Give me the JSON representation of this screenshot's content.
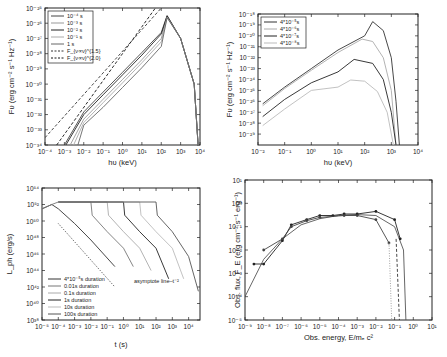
{
  "chart_data": [
    {
      "id": "panel_a",
      "type": "line",
      "title": "",
      "xlabel": "hν (keV)",
      "ylabel": "Fν (erg cm⁻² s⁻¹ Hz⁻¹)",
      "xscale": "log",
      "yscale": "log",
      "xlim": [
        0.0001,
        10000.0
      ],
      "ylim": [
        1e-34,
        1e-25
      ],
      "xticks": [
        "10⁻⁴",
        "10⁻³",
        "10⁻²",
        "10⁻¹",
        "10⁰",
        "10¹",
        "10²",
        "10³",
        "10⁴"
      ],
      "yticks": [
        "10⁻³⁴",
        "10⁻³³",
        "10⁻³²",
        "10⁻³¹",
        "10⁻³⁰",
        "10⁻²⁹",
        "10⁻²⁸",
        "10⁻²⁷",
        "10⁻²⁶",
        "10⁻²⁵"
      ],
      "legend_position": "upper left",
      "series": [
        {
          "name": "10⁻⁴ s",
          "style": "solid",
          "color": "#444444",
          "x": [
            0.001,
            0.01,
            0.1,
            1,
            10,
            100,
            200,
            1000,
            5000,
            8000
          ],
          "y": [
            1e-34,
            1.5e-32,
            3e-31,
            6e-30,
            1.2e-28,
            2.5e-27,
            3.2e-26,
            1e-27,
            1e-30,
            1e-34
          ]
        },
        {
          "name": "10⁻³ s",
          "style": "solid",
          "color": "#999999",
          "x": [
            0.002,
            0.01,
            0.1,
            1,
            10,
            100,
            200,
            1000,
            5000,
            8000
          ],
          "y": [
            1e-34,
            5e-33,
            1e-31,
            2e-30,
            4e-29,
            1e-27,
            2.7e-26,
            1e-27,
            1e-30,
            1e-34
          ]
        },
        {
          "name": "10⁻² s",
          "style": "solid",
          "color": "#222222",
          "x": [
            0.0012,
            0.01,
            0.1,
            1,
            10,
            100,
            200,
            1000,
            5000,
            8000
          ],
          "y": [
            1e-34,
            1e-32,
            2e-31,
            4e-30,
            8e-29,
            2e-27,
            3e-26,
            1e-27,
            1e-30,
            1e-34
          ]
        },
        {
          "name": "10⁻¹ s",
          "style": "solid",
          "color": "#aaaaaa",
          "x": [
            0.003,
            0.01,
            0.1,
            1,
            10,
            100,
            200,
            1000,
            5000,
            8000
          ],
          "y": [
            1e-34,
            3e-33,
            6e-32,
            1.2e-30,
            2.5e-29,
            6e-28,
            2.5e-26,
            1e-27,
            1e-30,
            1e-34
          ]
        },
        {
          "name": "1   s",
          "style": "solid",
          "color": "#666666",
          "x": [
            0.005,
            0.01,
            0.1,
            1,
            10,
            100,
            200,
            1000,
            5000,
            8000
          ],
          "y": [
            1e-34,
            2e-33,
            3e-32,
            6e-31,
            1.2e-29,
            3e-28,
            2.3e-26,
            1e-27,
            1e-30,
            1e-34
          ]
        },
        {
          "name": "F_{ν∝ν}^{1.5}",
          "style": "dashed",
          "color": "#333333",
          "x": [
            0.0001,
            100
          ],
          "y": [
            3e-34,
            1e-25
          ]
        },
        {
          "name": "F_{ν∝ν}^{2.0}",
          "style": "dashed",
          "color": "#111111",
          "x": [
            0.0004,
            50
          ],
          "y": [
            1e-34,
            1e-25
          ]
        }
      ]
    },
    {
      "id": "panel_b",
      "type": "line",
      "title": "",
      "xlabel": "hν (keV)",
      "ylabel": "Fν (erg cm⁻² s⁻¹ Hz⁻¹)",
      "xscale": "log",
      "yscale": "log",
      "xlim": [
        0.01,
        10000.0
      ],
      "ylim": [
        1e-30,
        1e-18
      ],
      "xticks": [
        "10⁻²",
        "10⁻¹",
        "10⁰",
        "10¹",
        "10²",
        "10³",
        "10⁴"
      ],
      "yticks": [
        "10⁻²⁹",
        "10⁻²⁸",
        "10⁻²⁷",
        "10⁻²⁶",
        "10⁻²⁵",
        "10⁻²⁴",
        "10⁻²³",
        "10⁻²²",
        "10⁻²¹",
        "10⁻²⁰",
        "10⁻¹⁹",
        "10⁻¹⁸"
      ],
      "legend_position": "upper left",
      "series": [
        {
          "name": "4*10⁻⁵s",
          "color": "#333333",
          "x": [
            0.015,
            0.1,
            1,
            10,
            100,
            200,
            500,
            1000,
            1500,
            2000
          ],
          "y": [
            6e-27,
            2e-25,
            1e-23,
            5e-22,
            1e-20,
            2e-19,
            3e-20,
            1e-22,
            1e-26,
            1e-30
          ]
        },
        {
          "name": "4*10⁻⁶s",
          "color": "#aaaaaa",
          "x": [
            0.015,
            0.1,
            1,
            10,
            80,
            200,
            500,
            1000,
            1500
          ],
          "y": [
            4e-27,
            1.5e-25,
            7e-24,
            3e-22,
            5e-21,
            3e-21,
            1e-22,
            1e-25,
            1e-30
          ]
        },
        {
          "name": "4*10⁻⁷s",
          "color": "#222222",
          "x": [
            0.015,
            0.1,
            1,
            10,
            40,
            200,
            500,
            1000,
            1500
          ],
          "y": [
            4e-28,
            1.5e-26,
            5e-25,
            5e-24,
            7e-23,
            3e-23,
            1e-24,
            1e-27,
            1e-30
          ]
        },
        {
          "name": "4*10⁻⁸s",
          "color": "#bbbbbb",
          "x": [
            0.015,
            0.1,
            1,
            10,
            30,
            100,
            300,
            700,
            1200
          ],
          "y": [
            6e-29,
            2e-27,
            1e-25,
            2e-25,
            9e-25,
            7e-25,
            8e-26,
            1e-27,
            1e-30
          ]
        }
      ]
    },
    {
      "id": "panel_c",
      "type": "line",
      "title": "",
      "xlabel": "t (s)",
      "ylabel": "L_ph (erg/s)",
      "xscale": "log",
      "yscale": "log",
      "xlim": [
        1e-05,
        50000.0
      ],
      "ylim": [
        1e+38,
        1e+54
      ],
      "xticks": [
        "10⁻⁵",
        "10⁻⁴",
        "10⁻³",
        "10⁻²",
        "10⁻¹",
        "10⁰",
        "10¹",
        "10²",
        "10³",
        "10⁴"
      ],
      "yticks": [
        "10³⁸",
        "10⁴⁰",
        "10⁴²",
        "10⁴⁴",
        "10⁴⁶",
        "10⁴⁸",
        "10⁵⁰",
        "10⁵²",
        "10⁵⁴"
      ],
      "legend_position": "lower left",
      "annotations": [
        {
          "text": "asymptote line–t⁻²",
          "x": 2,
          "y": 1e+41
        }
      ],
      "series": [
        {
          "name": "4*10⁻⁵s duration",
          "color": "#333333",
          "x": [
            1e-05,
            4e-05,
            0.0001,
            0.001,
            0.01,
            0.3
          ],
          "y": [
            3e+51,
            1e+52,
            3e+51,
            5e+49,
            5e+47,
            3e+44
          ]
        },
        {
          "name": "0.01s  duration",
          "color": "#777777",
          "x": [
            1e-05,
            4e-05,
            0.0001,
            0.01,
            0.012,
            0.1,
            1,
            4
          ],
          "y": [
            3e+51,
            1e+52,
            2e+52,
            2e+52,
            5e+50,
            5e+48,
            5e+46,
            3e+44
          ]
        },
        {
          "name": "0.1s   duration",
          "color": "#aaaaaa",
          "x": [
            0.0001,
            0.1,
            0.12,
            1,
            10,
            50
          ],
          "y": [
            2e+52,
            2e+52,
            5e+50,
            5e+48,
            5e+46,
            1e+44
          ]
        },
        {
          "name": "1s     duration",
          "color": "#222222",
          "x": [
            0.0001,
            1,
            1.2,
            10,
            100,
            600
          ],
          "y": [
            2e+52,
            2e+52,
            5e+50,
            5e+48,
            5e+46,
            1e+43
          ]
        },
        {
          "name": "10s    duration",
          "color": "#bbbbbb",
          "x": [
            0.0001,
            10,
            12,
            100,
            1000,
            5000
          ],
          "y": [
            2e+52,
            2e+52,
            5e+50,
            5e+48,
            5e+46,
            1e+43
          ]
        },
        {
          "name": "100s   duration",
          "color": "#555555",
          "x": [
            0.0001,
            100,
            120,
            1000,
            10000,
            40000
          ],
          "y": [
            2e+52,
            2e+52,
            5e+50,
            5e+48,
            5e+45,
            3e+41
          ]
        },
        {
          "name": "asymptote line–t⁻²",
          "style": "dotted",
          "color": "#333333",
          "x": [
            0.0001,
            0.3
          ],
          "y": [
            5e+49,
            1e+42
          ]
        }
      ]
    },
    {
      "id": "panel_d",
      "type": "line",
      "title": "",
      "xlabel": "Obs. energy, E/mₑc²",
      "ylabel": "Obs. flux, F_E (erg cm⁻² s⁻¹ erg⁻¹)",
      "xscale": "log",
      "yscale": "log",
      "xlim": [
        1e-09,
        10
      ],
      "ylim": [
        1e-05,
        10
      ],
      "xticks": [
        "10⁻⁹",
        "10⁻⁸",
        "10⁻⁷",
        "10⁻⁶",
        "10⁻⁵",
        "10⁻⁴",
        "10⁻³",
        "10⁻²",
        "10⁻¹",
        "10⁰",
        "10¹"
      ],
      "yticks": [
        "10⁻⁵",
        "10⁻⁴",
        "10⁻³",
        "10⁻²",
        "10⁻¹",
        "10⁰",
        "10¹"
      ],
      "series": [
        {
          "name": "model",
          "style": "solid",
          "color": "#555555",
          "x": [
            1e-09,
            1e-08,
            1e-07,
            1e-06,
            1e-05,
            0.0001,
            0.001,
            0.01,
            0.1,
            0.3,
            0.4
          ],
          "y": [
            0.0001,
            0.004,
            0.03,
            0.12,
            0.22,
            0.3,
            0.33,
            0.3,
            0.1,
            0.01,
            1e-05
          ]
        },
        {
          "name": "data-1",
          "style": "solid-markers",
          "color": "#222222",
          "x": [
            3e-09,
            1e-08,
            1e-07,
            3e-07,
            2e-06,
            1e-05,
            5e-05,
            0.0002,
            0.001,
            0.01,
            0.1,
            0.2
          ],
          "y": [
            0.0025,
            0.0025,
            0.025,
            0.12,
            0.2,
            0.3,
            0.3,
            0.35,
            0.35,
            0.45,
            0.2,
            0.03
          ]
        },
        {
          "name": "data-2",
          "style": "solid-markers",
          "color": "#444444",
          "x": [
            1e-08,
            1e-07,
            3e-07,
            2e-06,
            1e-05,
            0.0002,
            0.001,
            0.01,
            0.05
          ],
          "y": [
            0.01,
            0.03,
            0.1,
            0.18,
            0.25,
            0.3,
            0.3,
            0.2,
            0.02
          ]
        },
        {
          "name": "dotted cutoff",
          "style": "dotted",
          "color": "#999999",
          "x": [
            0.05,
            0.07
          ],
          "y": [
            0.02,
            1e-05
          ]
        },
        {
          "name": "dashed cutoff",
          "style": "dashed",
          "color": "#333333",
          "x": [
            0.12,
            0.18
          ],
          "y": [
            0.03,
            1e-05
          ]
        }
      ]
    }
  ],
  "panels": {
    "a": {
      "ylabel": "Fυ (erg cm⁻² s⁻¹ Hz⁻¹)",
      "xlabel": "hυ (keV)",
      "legend": [
        "10⁻⁴ s",
        "10⁻³ s",
        "10⁻² s",
        "10⁻¹ s",
        "1    s",
        "F_{ν∝ν}^{1.5}",
        "F_{ν∝ν}^{2.0}"
      ]
    },
    "b": {
      "ylabel": "Fυ (erg cm⁻² s⁻¹ Hz⁻¹)",
      "xlabel": "hυ (keV)",
      "legend": [
        "4*10⁻⁵s",
        "4*10⁻⁶s",
        "4*10⁻⁷s",
        "4*10⁻⁸s"
      ]
    },
    "c": {
      "ylabel": "L_ph (erg/s)",
      "xlabel": "t (s)",
      "annotation": "asymptote line–t⁻²",
      "legend": [
        "4*10⁻⁵s duration",
        "0.01s  duration",
        "0.1s   duration",
        "1s     duration",
        "10s    duration",
        "100s   duration"
      ]
    },
    "d": {
      "ylabel": "Obs. flux, F_E (erg cm⁻² s⁻¹ erg⁻¹)",
      "xlabel": "Obs. energy, E/mₑ c²"
    }
  }
}
